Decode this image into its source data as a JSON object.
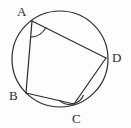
{
  "figure": {
    "name": "cyclic-quadrilateral-abcd",
    "background_color": "#fdfdfd",
    "stroke_color": "#2b2b2b",
    "circle": {
      "center_x": 60,
      "center_y": 59,
      "radius": 48,
      "stroke_width": 1.2
    },
    "vertices": [
      {
        "id": "A",
        "label": "A",
        "x": 32,
        "y": 21,
        "label_x": 17,
        "label_y": 5,
        "angle_marked": true
      },
      {
        "id": "B",
        "label": "B",
        "x": 26,
        "y": 93,
        "label_x": 9,
        "label_y": 89,
        "angle_marked": false
      },
      {
        "id": "C",
        "label": "C",
        "x": 74,
        "y": 104,
        "label_x": 72,
        "label_y": 112,
        "angle_marked": true
      },
      {
        "id": "D",
        "label": "D",
        "x": 106,
        "y": 58,
        "label_x": 112,
        "label_y": 51,
        "angle_marked": false
      }
    ],
    "edges": [
      {
        "id": "AB",
        "from": "A",
        "to": "B",
        "x1": 32,
        "y1": 21,
        "x2": 26,
        "y2": 93
      },
      {
        "id": "BC",
        "from": "B",
        "to": "C",
        "x1": 26,
        "y1": 93,
        "x2": 74,
        "y2": 104
      },
      {
        "id": "CD",
        "from": "C",
        "to": "D",
        "x1": 74,
        "y1": 104,
        "x2": 106,
        "y2": 58
      },
      {
        "id": "DA",
        "from": "D",
        "to": "A",
        "x1": 106,
        "y1": 58,
        "x2": 32,
        "y2": 21
      }
    ],
    "angle_arcs": [
      {
        "id": "angle-A",
        "at_vertex": "A",
        "path": "M 30.8 37.0 A 16 16 0 0 0 45.9 27.1"
      },
      {
        "id": "angle-C",
        "at_vertex": "C",
        "path": "M 59.6 100.6 A 15 15 0 0 0 83.5 95.0"
      }
    ]
  }
}
